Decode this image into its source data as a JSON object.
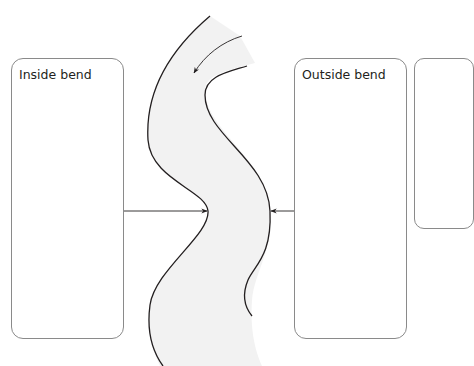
{
  "diagram": {
    "type": "river-meander",
    "labels": {
      "inside_bend": "Inside bend",
      "outside_bend": "Outside bend"
    },
    "colors": {
      "river_fill": "#f2f2f2",
      "bank_stroke": "#231f20",
      "box_border": "#8a8a8a",
      "arrow": "#231f20"
    },
    "elements": {
      "boxes": [
        {
          "id": "inside-bend-box",
          "label": "Inside bend"
        },
        {
          "id": "outside-bend-box",
          "label": "Outside bend"
        },
        {
          "id": "third-box-partial",
          "label": ""
        }
      ],
      "arrows": [
        {
          "id": "flow-direction-arrow",
          "meaning": "river flow direction"
        },
        {
          "id": "inside-pointer",
          "from": "inside-bend-box",
          "to": "inside bank"
        },
        {
          "id": "outside-pointer",
          "from": "outside-bend-box",
          "to": "outside bank"
        }
      ]
    }
  }
}
